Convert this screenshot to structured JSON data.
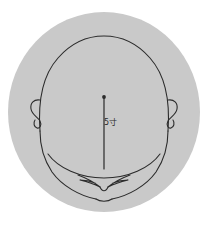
{
  "figure": {
    "type": "anatomical-line-drawing",
    "background_color": "#ffffff",
    "disc": {
      "name": "gray-circular-backdrop",
      "fill_color": "#c9c9c9",
      "center_x": 104,
      "center_y": 112,
      "radius_x": 96,
      "radius_y": 100
    },
    "line_color": "#2b2b2b",
    "annotation": {
      "label": "5寸",
      "unit_name": "cun",
      "value": "5",
      "color": "#2b2b2b",
      "position_x": 104,
      "position_y": 118
    },
    "measurement_line": {
      "name": "vertical-measure-line",
      "start_x": 104,
      "start_y": 97,
      "end_x": 104,
      "end_y": 169,
      "endpoint_marker": "dot"
    },
    "parts": [
      {
        "name": "cranium-outline",
        "label": "Cranium / skull dome"
      },
      {
        "name": "left-ear",
        "label": "Left ear"
      },
      {
        "name": "right-ear",
        "label": "Right ear"
      },
      {
        "name": "jaw-line",
        "label": "Jaw / mandible curve"
      },
      {
        "name": "chin-outline",
        "label": "Chin"
      },
      {
        "name": "nose-mouth-detail",
        "label": "Nose and mouth V detail"
      }
    ]
  }
}
